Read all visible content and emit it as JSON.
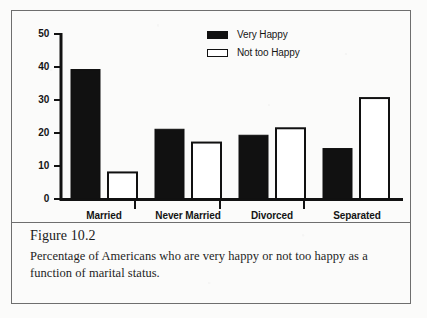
{
  "figure": {
    "caption_title": "Figure 10.2",
    "caption_text": "Percentage of Americans who are very happy or not too happy as a function of marital status."
  },
  "legend": {
    "position": "top-center-right",
    "items": [
      {
        "label": "Very Happy",
        "swatch": "filled-black-square-icon",
        "color": "#111111"
      },
      {
        "label": "Not too Happy",
        "swatch": "hollow-white-square-icon",
        "color": "#ffffff"
      }
    ]
  },
  "axis": {
    "y_ticks": [
      "0",
      "10",
      "20",
      "30",
      "40",
      "50"
    ],
    "x_categories": [
      "Married",
      "Never Married",
      "Divorced",
      "Separated"
    ]
  },
  "chart_data": {
    "type": "bar",
    "title": "",
    "subtitle": "",
    "xlabel": "",
    "ylabel": "",
    "ylim": [
      0,
      50
    ],
    "ytick_step": 10,
    "grid": false,
    "legend_position": "top-right",
    "categories": [
      "Married",
      "Never Married",
      "Divorced",
      "Separated"
    ],
    "series": [
      {
        "name": "Very Happy",
        "fill": "#111111",
        "values": [
          39,
          21,
          19.2,
          15.2
        ]
      },
      {
        "name": "Not too Happy",
        "fill": "#ffffff",
        "values": [
          8,
          17,
          21.3,
          30.4
        ]
      }
    ]
  }
}
